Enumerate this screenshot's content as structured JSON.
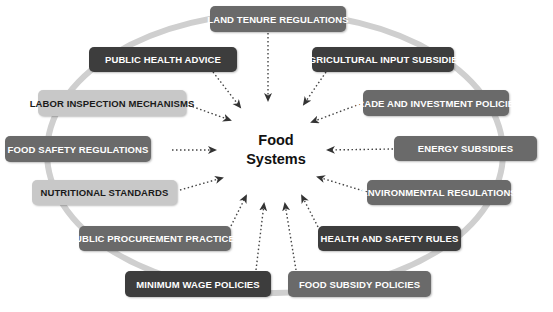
{
  "diagram": {
    "center": {
      "line1": "Food",
      "line2": "Systems"
    },
    "colors": {
      "dark": "#3d3d3d",
      "mid": "#6a6a6a",
      "light": "#c8c8c8",
      "ring": "#cccccc",
      "arrow": "#333333"
    },
    "nodes": [
      {
        "id": "land-tenure",
        "label": "LAND TENURE REGULATIONS"
      },
      {
        "id": "public-health",
        "label": "PUBLIC HEALTH ADVICE"
      },
      {
        "id": "agri-input",
        "label": "AGRICULTURAL INPUT SUBSIDIES"
      },
      {
        "id": "labor-inspection",
        "label": "LABOR INSPECTION MECHANISMS"
      },
      {
        "id": "trade-investment",
        "label": "TRADE AND INVESTMENT POLICIES"
      },
      {
        "id": "food-safety",
        "label": "FOOD SAFETY REGULATIONS"
      },
      {
        "id": "energy-subsidies",
        "label": "ENERGY SUBSIDIES"
      },
      {
        "id": "nutritional-standards",
        "label": "NUTRITIONAL STANDARDS"
      },
      {
        "id": "environmental-regs",
        "label": "ENVIRONMENTAL  REGULATIONS"
      },
      {
        "id": "public-procurement",
        "label": "PUBLIC PROCUREMENT PRACTICES"
      },
      {
        "id": "health-safety",
        "label": "HEALTH AND SAFETY RULES"
      },
      {
        "id": "minimum-wage",
        "label": "MINIMUM WAGE POLICIES"
      },
      {
        "id": "food-subsidy",
        "label": "FOOD SUBSIDY POLICIES"
      }
    ]
  }
}
